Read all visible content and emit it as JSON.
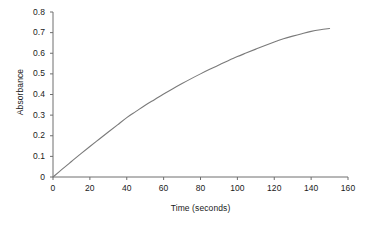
{
  "chart_data": {
    "type": "line",
    "title": "",
    "xlabel": "Time (seconds)",
    "ylabel": "Absorbance",
    "xlim": [
      0,
      160
    ],
    "ylim": [
      0,
      0.8
    ],
    "grid": false,
    "legend": null,
    "xticks": [
      0,
      20,
      40,
      60,
      80,
      100,
      120,
      140,
      160
    ],
    "xtick_labels": [
      "0",
      "20",
      "40",
      "60",
      "80",
      "100",
      "120",
      "140",
      "160"
    ],
    "yticks": [
      0,
      0.1,
      0.2,
      0.3,
      0.4,
      0.5,
      0.6,
      0.7,
      0.8
    ],
    "ytick_labels": [
      "0",
      "0.1",
      "0.2",
      "0.3",
      "0.4",
      "0.5",
      "0.6",
      "0.7",
      "0.8"
    ],
    "line_color": "#7a7a7a",
    "axis_color": "#6e6e6e",
    "background": "#ffffff",
    "series": [
      {
        "name": "Absorbance",
        "x": [
          0,
          5,
          10,
          15,
          20,
          25,
          30,
          35,
          40,
          45,
          50,
          55,
          60,
          65,
          70,
          75,
          80,
          85,
          90,
          95,
          100,
          105,
          110,
          115,
          120,
          125,
          130,
          135,
          140,
          145,
          150
        ],
        "values": [
          0.0,
          0.038,
          0.075,
          0.112,
          0.148,
          0.183,
          0.218,
          0.253,
          0.288,
          0.318,
          0.348,
          0.375,
          0.402,
          0.428,
          0.453,
          0.477,
          0.5,
          0.522,
          0.543,
          0.564,
          0.584,
          0.602,
          0.62,
          0.638,
          0.655,
          0.67,
          0.683,
          0.695,
          0.706,
          0.714,
          0.72
        ]
      }
    ]
  },
  "axes": {
    "x_title": "Time (seconds)",
    "y_title": "Absorbance"
  }
}
